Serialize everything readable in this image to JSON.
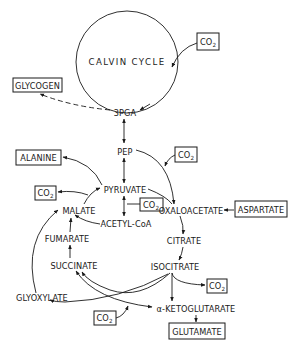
{
  "diagram": {
    "cycle_label": "CALVIN CYCLE",
    "nodes": {
      "pga": "3PGA",
      "pep": "PEP",
      "pyruvate": "PYRUVATE",
      "acetyl_coa": "ACETYL-CoA",
      "oxaloacetate": "OXALOACETATE",
      "citrate": "CITRATE",
      "isocitrate": "ISOCITRATE",
      "ketoglutarate": "α-KETOGLUTARATE",
      "malate": "MALATE",
      "fumarate": "FUMARATE",
      "succinate": "SUCCINATE",
      "glyoxylate": "GLYOXYLATE"
    },
    "boxed_products": {
      "glycogen": "GLYCOGEN",
      "alanine": "ALANINE",
      "aspartate": "ASPARTATE",
      "glutamate": "GLUTAMATE"
    },
    "co2": {
      "base": "CO",
      "subscript": "2",
      "instances": [
        "calvin-input",
        "pep-carboxylation",
        "malate-decarboxylation",
        "pyruvate-decarboxylation",
        "isocitrate-decarboxylation",
        "ketoglutarate-decarboxylation"
      ]
    }
  }
}
